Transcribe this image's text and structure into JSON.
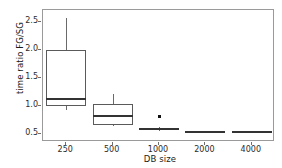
{
  "chart_data": {
    "type": "box",
    "title": "",
    "xlabel": "DB size",
    "ylabel": "time ratio FG/SG",
    "categories": [
      "250",
      "500",
      "1000",
      "2000",
      "4000"
    ],
    "ylim": [
      0.35,
      2.72
    ],
    "yticks": [
      0.5,
      1.0,
      1.5,
      2.0,
      2.5
    ],
    "ytick_labels": [
      "0.5",
      "1.0",
      "1.5",
      "2.0",
      "2.5"
    ],
    "grid": false,
    "legend": "none",
    "boxes": [
      {
        "category": "250",
        "whisker_low": 0.92,
        "q1": 1.0,
        "median": 1.13,
        "q3": 2.0,
        "whisker_high": 2.58,
        "outliers": []
      },
      {
        "category": "500",
        "whisker_low": 0.63,
        "q1": 0.65,
        "median": 0.81,
        "q3": 1.04,
        "whisker_high": 1.22,
        "outliers": []
      },
      {
        "category": "1000",
        "whisker_low": 0.55,
        "q1": 0.56,
        "median": 0.58,
        "q3": 0.61,
        "whisker_high": 0.62,
        "outliers": [
          0.81
        ]
      },
      {
        "category": "2000",
        "whisker_low": 0.52,
        "q1": 0.525,
        "median": 0.535,
        "q3": 0.545,
        "whisker_high": 0.55,
        "outliers": []
      },
      {
        "category": "4000",
        "whisker_low": 0.52,
        "q1": 0.525,
        "median": 0.532,
        "q3": 0.542,
        "whisker_high": 0.55,
        "outliers": []
      }
    ]
  },
  "colors": {
    "panel_background": "#ffffff",
    "panel_border": "#9a9a9a",
    "box_stroke": "#5a5a5a",
    "median": "#333333",
    "whisker": "#6a6a6a",
    "outlier": "#111111",
    "text": "#2b2b2b"
  }
}
